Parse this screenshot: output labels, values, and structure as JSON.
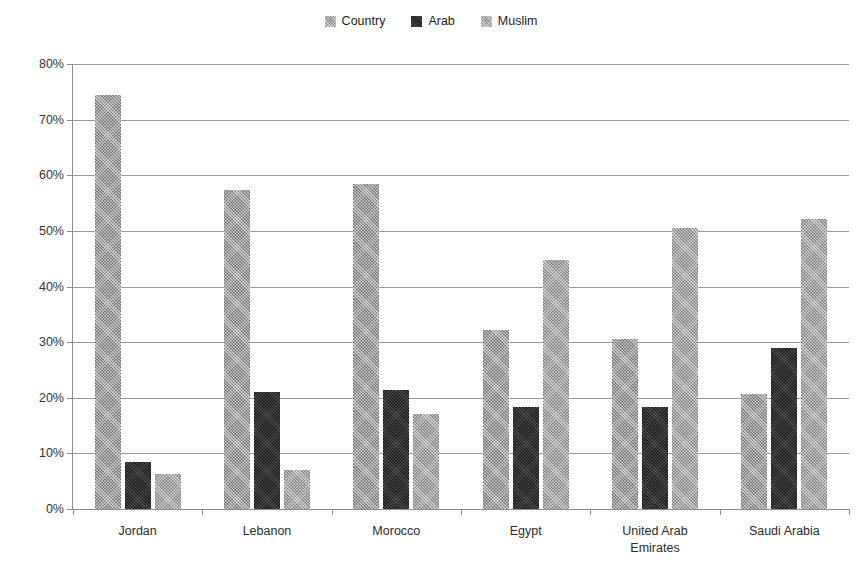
{
  "legend": {
    "position": "top-center",
    "entries": [
      {
        "label": "Country",
        "icon": "hatched-gray-swatch",
        "color": "#7d7d7d"
      },
      {
        "label": "Arab",
        "icon": "solid-black-swatch",
        "color": "#222222"
      },
      {
        "label": "Muslim",
        "icon": "hatched-gray-swatch",
        "color": "#8a8a8a"
      }
    ]
  },
  "axis": {
    "y_ticks": [
      "0%",
      "10%",
      "20%",
      "30%",
      "40%",
      "50%",
      "60%",
      "70%",
      "80%"
    ]
  },
  "chart_data": {
    "type": "bar",
    "title": "",
    "subtitle": "",
    "xlabel": "",
    "ylabel": "",
    "ylim": [
      0,
      80
    ],
    "ytick_values": [
      0,
      10,
      20,
      30,
      40,
      50,
      60,
      70,
      80
    ],
    "ytick_labels": [
      "0%",
      "10%",
      "20%",
      "30%",
      "40%",
      "50%",
      "60%",
      "70%",
      "80%"
    ],
    "grid": true,
    "legend_position": "top-center",
    "categories": [
      "Jordan",
      "Lebanon",
      "Morocco",
      "Egypt",
      "United Arab\nEmirates",
      "Saudi Arabia"
    ],
    "series": [
      {
        "name": "Country",
        "color": "#7b7b7b",
        "values": [
          74.5,
          57.3,
          58.4,
          32.2,
          30.6,
          20.6
        ]
      },
      {
        "name": "Arab",
        "color": "#1e1e1e",
        "values": [
          8.5,
          21.0,
          21.4,
          18.4,
          18.4,
          28.9
        ]
      },
      {
        "name": "Muslim",
        "color": "#878787",
        "values": [
          6.3,
          7.1,
          17.0,
          44.8,
          50.5,
          52.2
        ]
      }
    ]
  }
}
